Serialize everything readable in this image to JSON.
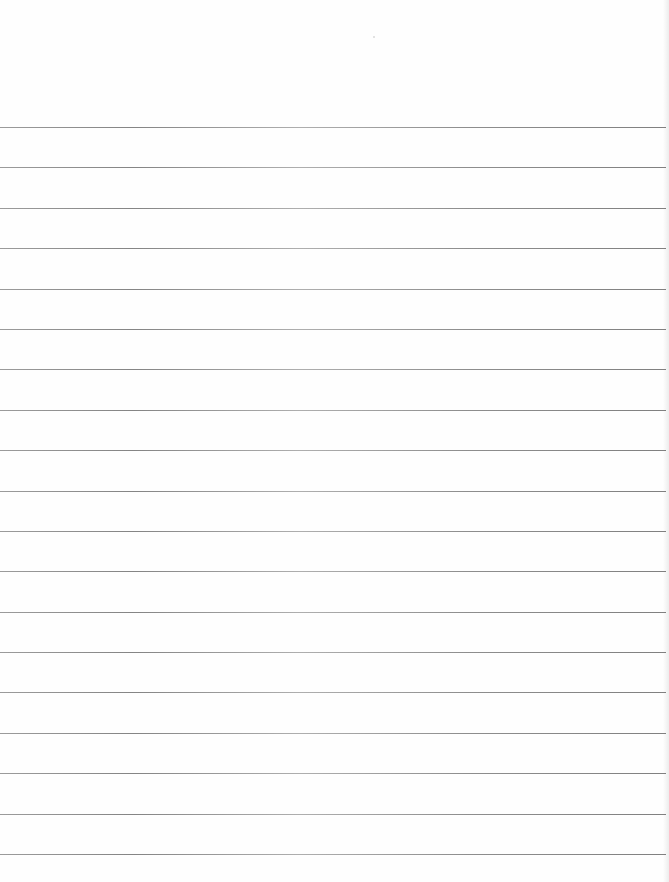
{
  "document": {
    "type": "ruled-paper",
    "background_color": "#fefefe",
    "line_color": "#7a7a7a",
    "line_count": 19,
    "text_content": []
  }
}
